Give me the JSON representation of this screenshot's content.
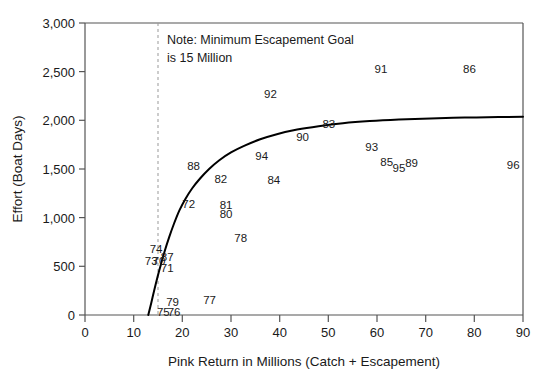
{
  "chart_data": {
    "type": "scatter",
    "title": "",
    "xlabel": "Pink Return in Millions (Catch + Escapement)",
    "ylabel": "Effort (Boat Days)",
    "xlim": [
      0,
      90
    ],
    "ylim": [
      0,
      3000
    ],
    "xticks": [
      0,
      10,
      20,
      30,
      40,
      50,
      60,
      70,
      80,
      90
    ],
    "xtick_labels": [
      "0",
      "10",
      "20",
      "30",
      "40",
      "50",
      "60",
      "70",
      "80",
      "90"
    ],
    "yticks": [
      0,
      500,
      1000,
      1500,
      2000,
      2500,
      3000
    ],
    "ytick_labels": [
      "0",
      "500",
      "1,000",
      "1,500",
      "2,000",
      "2,500",
      "3,000"
    ],
    "grid": false,
    "legend": null,
    "annotations": [
      {
        "name": "note",
        "lines": [
          "Note: Minimum Escapement Goal",
          "is 15 Million"
        ],
        "x": 16.5,
        "y": 2870
      },
      {
        "name": "escapement-goal-line",
        "type": "vline",
        "x": 15,
        "style": "dashed",
        "color": "#999999"
      }
    ],
    "fit_curve": {
      "name": "effort-response-curve",
      "color": "#000000",
      "width": 2.0,
      "points": [
        [
          13.0,
          0
        ],
        [
          13.6,
          120
        ],
        [
          14.2,
          250
        ],
        [
          14.9,
          390
        ],
        [
          15.6,
          520
        ],
        [
          16.4,
          660
        ],
        [
          17.3,
          800
        ],
        [
          18.3,
          940
        ],
        [
          19.4,
          1075
        ],
        [
          20.6,
          1190
        ],
        [
          22.0,
          1300
        ],
        [
          23.6,
          1400
        ],
        [
          25.5,
          1500
        ],
        [
          27.6,
          1590
        ],
        [
          30.0,
          1670
        ],
        [
          32.8,
          1740
        ],
        [
          36.0,
          1805
        ],
        [
          39.6,
          1860
        ],
        [
          43.6,
          1905
        ],
        [
          48.0,
          1940
        ],
        [
          53.0,
          1970
        ],
        [
          58.5,
          1992
        ],
        [
          64.5,
          2008
        ],
        [
          71.0,
          2020
        ],
        [
          78.0,
          2028
        ],
        [
          85.0,
          2034
        ],
        [
          90.0,
          2037
        ]
      ]
    },
    "labels_note": "Each data point is rendered as its two-digit year label text at the point location (no marker symbol).",
    "points": [
      {
        "label": "73",
        "x": 13.6,
        "y": 555
      },
      {
        "label": "70",
        "x": 15.2,
        "y": 555
      },
      {
        "label": "74",
        "x": 14.6,
        "y": 680
      },
      {
        "label": "87",
        "x": 16.9,
        "y": 600
      },
      {
        "label": "71",
        "x": 16.9,
        "y": 480
      },
      {
        "label": "75",
        "x": 16.1,
        "y": 30
      },
      {
        "label": "76",
        "x": 18.3,
        "y": 30
      },
      {
        "label": "79",
        "x": 18.0,
        "y": 130
      },
      {
        "label": "77",
        "x": 25.6,
        "y": 155
      },
      {
        "label": "72",
        "x": 21.3,
        "y": 1140
      },
      {
        "label": "88",
        "x": 22.3,
        "y": 1530
      },
      {
        "label": "82",
        "x": 27.9,
        "y": 1395
      },
      {
        "label": "81",
        "x": 29.0,
        "y": 1130
      },
      {
        "label": "80",
        "x": 29.0,
        "y": 1040
      },
      {
        "label": "78",
        "x": 32.0,
        "y": 790
      },
      {
        "label": "84",
        "x": 38.8,
        "y": 1390
      },
      {
        "label": "94",
        "x": 36.3,
        "y": 1630
      },
      {
        "label": "90",
        "x": 44.7,
        "y": 1830
      },
      {
        "label": "83",
        "x": 50.1,
        "y": 1965
      },
      {
        "label": "92",
        "x": 38.1,
        "y": 2275
      },
      {
        "label": "91",
        "x": 60.8,
        "y": 2525
      },
      {
        "label": "86",
        "x": 79.0,
        "y": 2525
      },
      {
        "label": "93",
        "x": 58.9,
        "y": 1730
      },
      {
        "label": "85",
        "x": 62.0,
        "y": 1570
      },
      {
        "label": "95",
        "x": 64.5,
        "y": 1510
      },
      {
        "label": "89",
        "x": 67.1,
        "y": 1565
      },
      {
        "label": "96",
        "x": 88.0,
        "y": 1545
      }
    ]
  },
  "colors": {
    "curve": "#000000",
    "axis": "#555555",
    "text": "#1a1a1a",
    "dashed_guide": "#999999",
    "background": "#ffffff"
  }
}
